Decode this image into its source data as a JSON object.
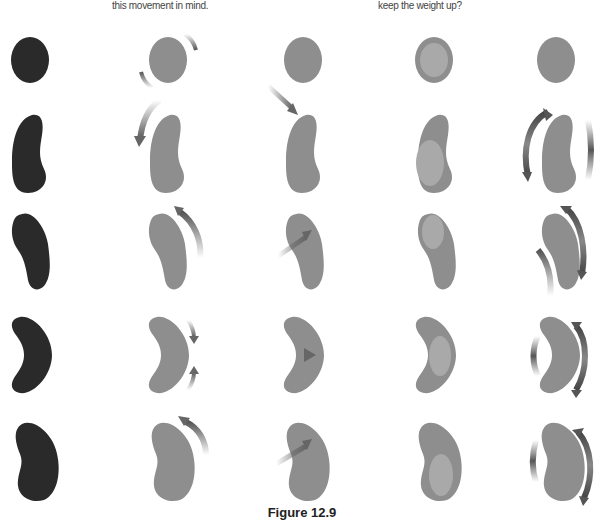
{
  "captions": {
    "left": "this movement in mind.",
    "right": "keep the weight up?"
  },
  "figure": {
    "title": "Figure 12.9"
  },
  "colors": {
    "dark_shape": "#2a2a2a",
    "gray_shape": "#8e8e8e",
    "inner_highlight": "#a9a9a9",
    "arrow": "#6e6e6e"
  },
  "grid": {
    "rows": [
      "circle",
      "bean-upright",
      "bean-narrow",
      "crescent",
      "bean-wide"
    ],
    "columns": [
      "silhouette",
      "rotation-arrows",
      "force-arrow",
      "inner-highlight",
      "side-arcs"
    ]
  }
}
